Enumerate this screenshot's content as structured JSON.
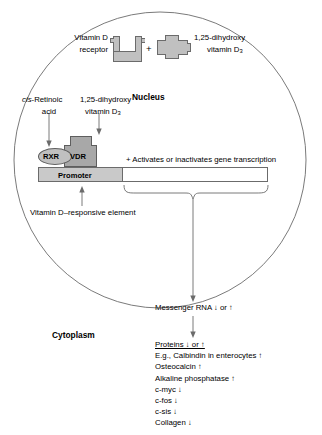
{
  "diagram": {
    "title_compartments": {
      "nucleus_label": "Nucleus",
      "cytoplasm_label": "Cytoplasm"
    },
    "top_reaction": {
      "receptor_label_line1": "Vitamin D",
      "receptor_label_line2": "receptor",
      "plus_sign": "+",
      "ligand_label_line1": "1,25-dihydroxy",
      "ligand_label_line2": "vitamin D",
      "ligand_label_subscript": "3"
    },
    "incoming_ligands": {
      "left_line1_italic": "cis",
      "left_line1_rest": "-Retinoic",
      "left_line2": "acid",
      "right_line1": "1,25-dihydroxy",
      "right_line2": "vitamin D",
      "right_subscript": "3"
    },
    "complex": {
      "rxr_label": "RXR",
      "vdr_label": "VDR",
      "promoter_label": "Promoter"
    },
    "transcription_note": "+ Activates or inactivates gene transcription",
    "vdre_label": "Vitamin D–responsive element",
    "mrna_label": "Messenger RNA ↓ or ↑",
    "outputs": {
      "header": "Proteins ↓ or ↑",
      "items": [
        "E.g., Calbindin in enterocytes ↑",
        "Osteocalcin ↑",
        "Alkaline phosphatase ↑",
        "c-myc ↓",
        "c-fos ↓",
        "c-sis ↓",
        "Collagen ↓"
      ],
      "italic_gene_items": [
        "c-myc",
        "c-fos",
        "c-sis"
      ]
    },
    "colors": {
      "outline": "#6b6b6b",
      "shape_fill": "#c0c0c0",
      "shape_fill_dark": "#a8a8a8",
      "promoter_fill": "#c9c9c9",
      "text": "#000000"
    }
  }
}
